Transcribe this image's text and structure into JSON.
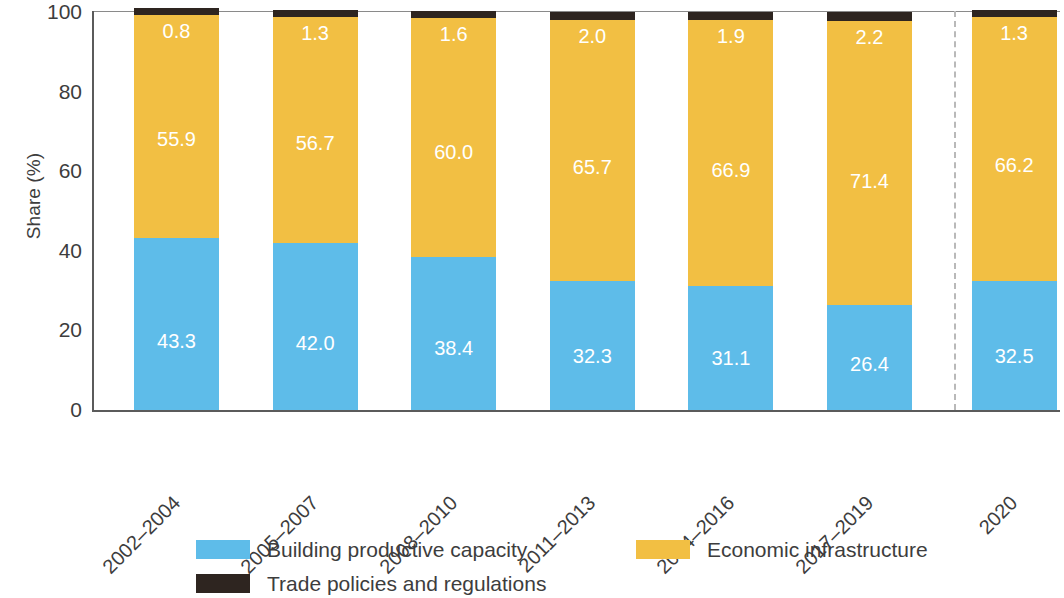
{
  "chart_data": {
    "type": "bar",
    "subtype": "stacked-100-percent",
    "title": "",
    "xlabel": "",
    "ylabel": "Share (%)",
    "ylim": [
      0,
      100
    ],
    "ytick_labels": [
      "0",
      "20",
      "40",
      "60",
      "80",
      "100"
    ],
    "yticks": [
      0,
      20,
      40,
      60,
      80,
      100
    ],
    "grid": false,
    "legend_position": "bottom",
    "categories": [
      "2002–2004",
      "2005–2007",
      "2008–2010",
      "2011–2013",
      "2014–2016",
      "2017–2019",
      "2020"
    ],
    "series": [
      {
        "name": "Building productive capacity",
        "color": "#5ebce9",
        "values": [
          43.3,
          42.0,
          38.4,
          32.3,
          31.1,
          26.4,
          32.5
        ]
      },
      {
        "name": "Economic infrastructure",
        "color": "#f2bf43",
        "values": [
          55.9,
          56.7,
          60.0,
          65.7,
          66.9,
          71.4,
          66.2
        ]
      },
      {
        "name": "Trade policies and regulations",
        "color": "#2e2520",
        "values": [
          0.8,
          1.3,
          1.6,
          2.0,
          1.9,
          2.2,
          1.3
        ]
      }
    ],
    "data_label_series": [
      "Building productive capacity",
      "Economic infrastructure",
      "Trade policies and regulations"
    ],
    "data_labels_shown_for": [
      "Building productive capacity",
      "Economic infrastructure"
    ],
    "annotations": [
      {
        "name": "category-separator",
        "type": "vertical-dashed-line",
        "after_category": "2017–2019"
      }
    ]
  },
  "legend": {
    "items": [
      {
        "label": "Building productive capacity",
        "color": "#5ebce9"
      },
      {
        "label": "Economic infrastructure",
        "color": "#f2bf43"
      },
      {
        "label": "Trade policies and regulations",
        "color": "#2e2520"
      }
    ]
  },
  "colors": {
    "blue": "#5ebce9",
    "yellow": "#f2bf43",
    "dark": "#2e2520",
    "axis": "#5b5b5b",
    "text": "#3d3d3d",
    "separator": "#b9b9b9"
  }
}
